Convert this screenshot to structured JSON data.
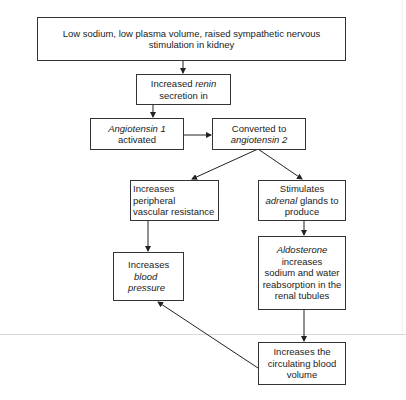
{
  "diagram": {
    "type": "flowchart",
    "nodes": {
      "trigger": {
        "lines": [
          "Low sodium, low plasma volume, raised sympathetic nervous",
          "stimulation in kidney"
        ]
      },
      "renin": {
        "pre": "Increased ",
        "em": "renin",
        "line2": "secretion in"
      },
      "ang1": {
        "em": "Angiotensin 1",
        "line2": "activated"
      },
      "ang2": {
        "line1": "Converted to",
        "em": "angiotensin 2"
      },
      "resistance": {
        "lines": [
          "Increases",
          "peripheral",
          "vascular resistance"
        ]
      },
      "adrenal": {
        "line1": "Stimulates",
        "em": "adrenal",
        "post": " glands to",
        "line3": "produce"
      },
      "bp": {
        "line1": "Increases",
        "em1": "blood",
        "em2": "pressure"
      },
      "aldosterone": {
        "em": "Aldosterone",
        "lines": [
          "increases",
          "sodium and water",
          "reabsorption in the",
          "renal tubules"
        ]
      },
      "volume": {
        "lines": [
          "Increases the",
          "circulating blood",
          "volume"
        ]
      }
    },
    "edges": [
      [
        "trigger",
        "renin"
      ],
      [
        "renin",
        "ang1"
      ],
      [
        "ang1",
        "ang2"
      ],
      [
        "ang2",
        "resistance"
      ],
      [
        "ang2",
        "adrenal"
      ],
      [
        "resistance",
        "bp"
      ],
      [
        "adrenal",
        "aldosterone"
      ],
      [
        "aldosterone",
        "volume"
      ],
      [
        "volume",
        "bp"
      ]
    ],
    "colors": {
      "stroke": "#333333",
      "background": "#ffffff",
      "divider": "#d8d8d8"
    }
  }
}
